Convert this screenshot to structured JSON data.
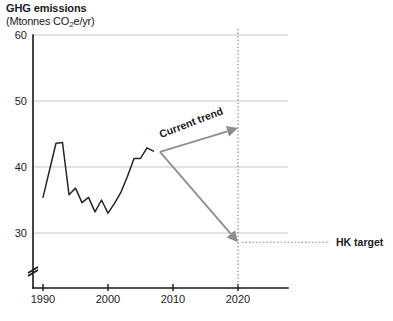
{
  "chart_data": {
    "type": "line",
    "title": "GHG emissions",
    "subtitle_prefix": "(Mtonnes CO",
    "subtitle_sub": "2",
    "subtitle_suffix": "e/yr)",
    "ylabel": "",
    "xlabel": "",
    "xlim": [
      1988,
      2026
    ],
    "ylim": [
      26,
      61
    ],
    "grid": true,
    "y_axis_break": true,
    "yticks": [
      30,
      40,
      50,
      60
    ],
    "ytick_labels": [
      "30",
      "40",
      "50",
      "60"
    ],
    "xticks": [
      1990,
      2000,
      2010,
      2020
    ],
    "xtick_labels": [
      "1990",
      "2000",
      "2010",
      "2020"
    ],
    "series": [
      {
        "name": "GHG emissions",
        "color": "#23272b",
        "x": [
          1990,
          1991,
          1992,
          1993,
          1994,
          1995,
          1996,
          1997,
          1998,
          1999,
          2000,
          2001,
          2002,
          2003,
          2004,
          2005,
          2006,
          2007
        ],
        "values": [
          35.4,
          39.5,
          43.6,
          43.7,
          35.8,
          36.8,
          34.6,
          35.4,
          33.2,
          35.0,
          33.0,
          34.5,
          36.2,
          38.6,
          41.3,
          41.3,
          42.9,
          42.4
        ]
      }
    ],
    "annotations": [
      {
        "id": "current-trend",
        "label": "Current trend",
        "type": "arrow",
        "color": "#8e8e8e",
        "from": {
          "x": 2008,
          "y": 42.3
        },
        "to": {
          "x": 2020,
          "y": 45.9
        },
        "rotation_deg": -21
      },
      {
        "id": "hk-target",
        "label": "HK target",
        "type": "arrow",
        "color": "#8e8e8e",
        "from": {
          "x": 2008,
          "y": 42.3
        },
        "to": {
          "x": 2020,
          "y": 28.6
        }
      }
    ],
    "reference_lines": [
      {
        "id": "year-2020-vline",
        "orientation": "vertical",
        "x": 2020,
        "style": "dotted",
        "color": "#8e8e8e"
      },
      {
        "id": "hk-target-leader",
        "orientation": "horizontal",
        "y": 28.6,
        "style": "dotted",
        "color": "#8e8e8e"
      }
    ]
  }
}
